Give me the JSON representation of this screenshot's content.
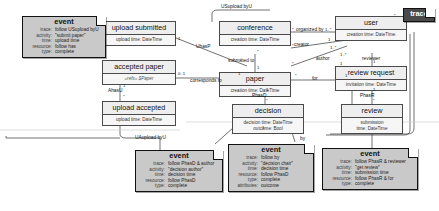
{
  "diagram": {
    "colors": {
      "class_fill": "#f2f2f2",
      "class_border": "#4a4a4a",
      "note_fill": "#c9c9c9",
      "note_border": "#111111",
      "trace_fill": "#4a4a4a",
      "trace_text": "#ffffff",
      "background": "#ffffff"
    }
  },
  "classes": [
    {
      "id": "upload-submitted",
      "name": "upload submitted",
      "attributes": [
        "upload time: DateTime"
      ]
    },
    {
      "id": "accepted-paper",
      "name": "accepted paper",
      "attributes": [
        "«refs» $Paper"
      ]
    },
    {
      "id": "upload-accepted",
      "name": "upload accepted",
      "attributes": [
        "upload time: DateTime"
      ]
    },
    {
      "id": "conference",
      "name": "conference",
      "attributes": [
        "creation time: DateTime"
      ]
    },
    {
      "id": "paper",
      "name": "paper",
      "attributes": [
        "creation time: DateTime"
      ]
    },
    {
      "id": "decision",
      "name": "decision",
      "attributes": [
        "decision time: DateTime",
        "outcome: Bool"
      ]
    },
    {
      "id": "user",
      "name": "user",
      "attributes": [
        "creation time: DateTime"
      ]
    },
    {
      "id": "review-request",
      "name": "review request",
      "attributes": [
        "invitation time: DateTime"
      ]
    },
    {
      "id": "review",
      "name": "review",
      "attributes": [
        "submission",
        "time: DateTime"
      ]
    }
  ],
  "notes": [
    {
      "id": "event-submit-paper",
      "title": "event",
      "rows": [
        {
          "key": "trace:",
          "value": "follow USupload byU"
        },
        {
          "key": "activity:",
          "value": "\"submit paper\""
        },
        {
          "key": "time:",
          "value": "upload time"
        },
        {
          "key": "resource:",
          "value": "follow has"
        },
        {
          "key": "type:",
          "value": "complete"
        }
      ]
    },
    {
      "id": "event-decision-author",
      "title": "event",
      "rows": [
        {
          "key": "trace:",
          "value": "follow PhasD & author"
        },
        {
          "key": "activity:",
          "value": "\"decision author\""
        },
        {
          "key": "time:",
          "value": "decision time"
        },
        {
          "key": "resource:",
          "value": "follow PhasD"
        },
        {
          "key": "type:",
          "value": "complete"
        }
      ]
    },
    {
      "id": "event-decision-chair",
      "title": "event",
      "rows": [
        {
          "key": "trace:",
          "value": "follow by"
        },
        {
          "key": "activity:",
          "value": "\"decision chair\""
        },
        {
          "key": "time:",
          "value": "decision time"
        },
        {
          "key": "resource:",
          "value": "follow PhasD"
        },
        {
          "key": "type:",
          "value": "complete"
        },
        {
          "key": "attributes:",
          "value": "outcome"
        }
      ]
    },
    {
      "id": "event-get-review",
      "title": "event",
      "rows": [
        {
          "key": "trace:",
          "value": "follow PhasR & reviewer"
        },
        {
          "key": "activity:",
          "value": "\"get review\""
        },
        {
          "key": "time:",
          "value": "submission time"
        },
        {
          "key": "resource:",
          "value": "follow PhasR & for"
        },
        {
          "key": "type:",
          "value": "complete"
        }
      ]
    },
    {
      "id": "trace-note",
      "title": "trace",
      "rows": []
    }
  ],
  "edge_labels": [
    {
      "id": "usupload-byu",
      "text": "USupload byU"
    },
    {
      "id": "uhasp",
      "text": "UhasP"
    },
    {
      "id": "corresponds-to",
      "text": "corresponds to"
    },
    {
      "id": "ahasu",
      "text": "AhasU"
    },
    {
      "id": "uaupload-byu",
      "text": "UAupload byU"
    },
    {
      "id": "organized-by",
      "text": "organized by"
    },
    {
      "id": "creator",
      "text": "creator"
    },
    {
      "id": "submitted-to",
      "text": "submitted to"
    },
    {
      "id": "author",
      "text": "author"
    },
    {
      "id": "for",
      "text": "for"
    },
    {
      "id": "phasd",
      "text": "PhasD"
    },
    {
      "id": "reviewer",
      "text": "reviewer"
    },
    {
      "id": "phasr",
      "text": "PhasR"
    },
    {
      "id": "by",
      "text": "by"
    }
  ],
  "multiplicities": [
    {
      "id": "m-uhasp-a",
      "text": "1"
    },
    {
      "id": "m-uhasp-b",
      "text": "*"
    },
    {
      "id": "m-corr-a",
      "text": "0..1"
    },
    {
      "id": "m-corr-b",
      "text": "1"
    },
    {
      "id": "m-ahasu-a",
      "text": "1"
    },
    {
      "id": "m-ahasu-b",
      "text": "*"
    },
    {
      "id": "m-org-a",
      "text": "*"
    },
    {
      "id": "m-org-b",
      "text": "1..*"
    },
    {
      "id": "m-sub-a",
      "text": "*"
    },
    {
      "id": "m-sub-b",
      "text": "1"
    },
    {
      "id": "m-creator-a",
      "text": "*"
    },
    {
      "id": "m-creator-b",
      "text": "1"
    },
    {
      "id": "m-author-a",
      "text": "*"
    },
    {
      "id": "m-author-b",
      "text": "1..*"
    },
    {
      "id": "m-phasd-a",
      "text": "1"
    },
    {
      "id": "m-phasd-b",
      "text": "*"
    },
    {
      "id": "m-rev-a",
      "text": "1..*"
    },
    {
      "id": "m-rev-b",
      "text": "1"
    },
    {
      "id": "m-for-a",
      "text": "*"
    },
    {
      "id": "m-for-b",
      "text": "1"
    },
    {
      "id": "m-phasr-a",
      "text": "1"
    },
    {
      "id": "m-phasr-b",
      "text": "*"
    },
    {
      "id": "m-trace-a",
      "text": "*"
    },
    {
      "id": "m-dec-a",
      "text": "1"
    },
    {
      "id": "m-rq-a",
      "text": "1"
    }
  ]
}
